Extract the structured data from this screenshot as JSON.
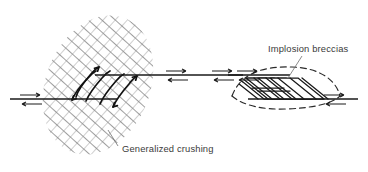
{
  "figure": {
    "background_color": "#ffffff",
    "width": 368,
    "height": 172,
    "ink_color": "#1a1a1a",
    "hatch_color": "#8d8d8d",
    "text_color": "#3a3a3a",
    "leader_color": "#6e6e6e"
  },
  "labels": [
    {
      "id": "generalized-crushing",
      "text": "Generalized crushing",
      "x": 122,
      "y": 152,
      "anchor": "start",
      "leader": {
        "x1": 118,
        "y1": 146,
        "x2": 108,
        "y2": 130
      }
    },
    {
      "id": "implosion-breccias",
      "text": "Implosion breccias",
      "x": 268,
      "y": 52,
      "anchor": "start",
      "leader": {
        "x1": 302,
        "y1": 56,
        "x2": 288,
        "y2": 78
      }
    }
  ],
  "structures": {
    "left_jog": {
      "name": "contractional-jog",
      "description": "Cross-hatched lens of generalized crushing with sigmoidal en-echelon fractures",
      "hatch_pattern": "cross-hatch-diamond",
      "lens_center_x": 98,
      "lens_center_y": 85,
      "lens_rx": 52,
      "lens_ry": 72,
      "lens_rotation_deg": 22,
      "sigmoid_count": 5
    },
    "right_jog": {
      "name": "dilational-jog",
      "description": "Stepped parallel slip surfaces bounded by a dashed lens, site of implosion breccias",
      "boundary_style": "dashed",
      "step_count": 4,
      "lens_center_x": 285,
      "lens_center_y": 87,
      "lens_rx": 62,
      "lens_ry": 22
    }
  },
  "fault_traces": [
    {
      "id": "lower-left-trace",
      "x1": 10,
      "y1": 99,
      "x2": 118,
      "y2": 99
    },
    {
      "id": "upper-mid-trace",
      "x1": 95,
      "y1": 75,
      "x2": 243,
      "y2": 75
    },
    {
      "id": "lower-right-trace",
      "x1": 228,
      "y1": 99,
      "x2": 358,
      "y2": 99
    }
  ],
  "shear_arrows": [
    {
      "id": "arrow-pair-far-left",
      "cx": 31,
      "cy": 99,
      "sense": "dextral",
      "top_dir": "right",
      "bottom_dir": "left"
    },
    {
      "id": "arrow-pair-mid-left",
      "cx": 176,
      "cy": 75,
      "sense": "dextral",
      "top_dir": "right",
      "bottom_dir": "left"
    },
    {
      "id": "arrow-pair-mid-right",
      "cx": 228,
      "cy": 75,
      "sense": "dextral",
      "top_dir": "right",
      "bottom_dir": "left"
    },
    {
      "id": "arrow-pair-upper-right",
      "cx": 247,
      "cy": 75,
      "sense": "dextral",
      "top_dir": "right",
      "bottom_dir": "left"
    },
    {
      "id": "arrow-pair-far-right",
      "cx": 334,
      "cy": 99,
      "sense": "dextral",
      "top_dir": "right",
      "bottom_dir": "left"
    }
  ]
}
